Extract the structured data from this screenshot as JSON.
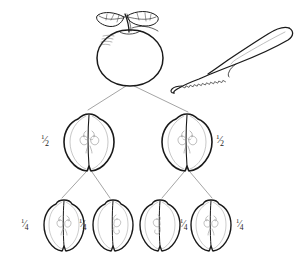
{
  "diagram": {
    "background_color": "#ffffff",
    "ink_color": "#1a1a1a",
    "connector_color": "#9a9a9a",
    "core_color": "#a8a8a8"
  },
  "whole": {
    "name": "whole-apple",
    "label": "",
    "center_x": 130,
    "center_y": 55
  },
  "knife": {
    "name": "knife",
    "label": "",
    "blade_edge": "serrated"
  },
  "halves": [
    {
      "label_num": "1",
      "label_slash": "⁄",
      "label_den": "2",
      "label_text": "1/2",
      "side": "left"
    },
    {
      "label_num": "1",
      "label_slash": "⁄",
      "label_den": "2",
      "label_text": "1/2",
      "side": "right"
    }
  ],
  "quarters": [
    {
      "label_num": "1",
      "label_slash": "⁄",
      "label_den": "4",
      "label_text": "1/4",
      "side": "left"
    },
    {
      "label_num": "1",
      "label_slash": "⁄",
      "label_den": "4",
      "label_text": "1/4",
      "side": "left"
    },
    {
      "label_num": "1",
      "label_slash": "⁄",
      "label_den": "4",
      "label_text": "1/4",
      "side": "right"
    },
    {
      "label_num": "1",
      "label_slash": "⁄",
      "label_den": "4",
      "label_text": "1/4",
      "side": "right"
    }
  ]
}
